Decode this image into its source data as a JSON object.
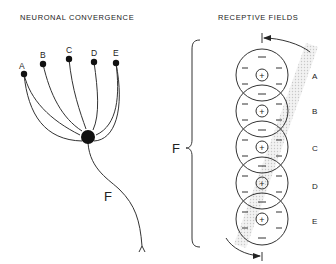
{
  "left_panel": {
    "title": "NEURONAL CONVERGENCE",
    "inputs": [
      "A",
      "B",
      "C",
      "D",
      "E"
    ],
    "output": "F"
  },
  "right_panel": {
    "title": "RECEPTIVE FIELDS",
    "fields": [
      {
        "label": "A",
        "center": "+",
        "surround": "−"
      },
      {
        "label": "B",
        "center": "+",
        "surround": "−"
      },
      {
        "label": "C",
        "center": "+",
        "surround": "−"
      },
      {
        "label": "D",
        "center": "+",
        "surround": "−"
      },
      {
        "label": "E",
        "center": "+",
        "surround": "−"
      }
    ],
    "combined_label": "F"
  }
}
